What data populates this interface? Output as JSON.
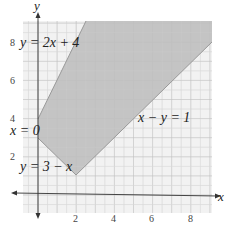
{
  "chart_data": {
    "type": "area",
    "title": "",
    "xlabel": "x",
    "ylabel": "y",
    "xlim": [
      -0.8,
      9.1
    ],
    "ylim": [
      -0.95,
      9.1
    ],
    "grid": true,
    "x_ticks": [
      "2",
      "4",
      "6",
      "8"
    ],
    "y_ticks": [
      "2",
      "4",
      "6",
      "8"
    ],
    "lines": [
      {
        "label": "y = 2x + 4",
        "equation": "y=2x+4"
      },
      {
        "label": "x − y = 1",
        "equation": "x-y=1"
      },
      {
        "label": "x = 0",
        "equation": "x=0"
      },
      {
        "label": "y = 3 − x",
        "equation": "y=3-x"
      }
    ],
    "shaded_region": {
      "description": "feasible region bounded by x=0, y=3-x, x-y=1, y=2x+4 (unbounded above)",
      "vertices": [
        [
          0,
          3
        ],
        [
          2,
          1
        ],
        [
          9,
          8
        ],
        [
          9,
          9
        ],
        [
          2.5,
          9
        ],
        [
          0,
          4
        ]
      ],
      "fill": "#bdbdbd"
    }
  },
  "labels": {
    "y_axis": "y",
    "x_axis": "x",
    "eq1": "y = 2x + 4",
    "eq2": "x − y = 1",
    "eq3": "x = 0",
    "eq4": "y = 3 − x",
    "xt2": "2",
    "xt4": "4",
    "xt6": "6",
    "xt8": "8",
    "yt2": "2",
    "yt4": "4",
    "yt6": "6",
    "yt8": "8"
  },
  "colors": {
    "grid_bg": "#f2f2f2",
    "grid_minor": "#dcdcdc",
    "grid_major": "#c8c8c8",
    "shade": "#bcbcbc",
    "axis": "#333333"
  }
}
